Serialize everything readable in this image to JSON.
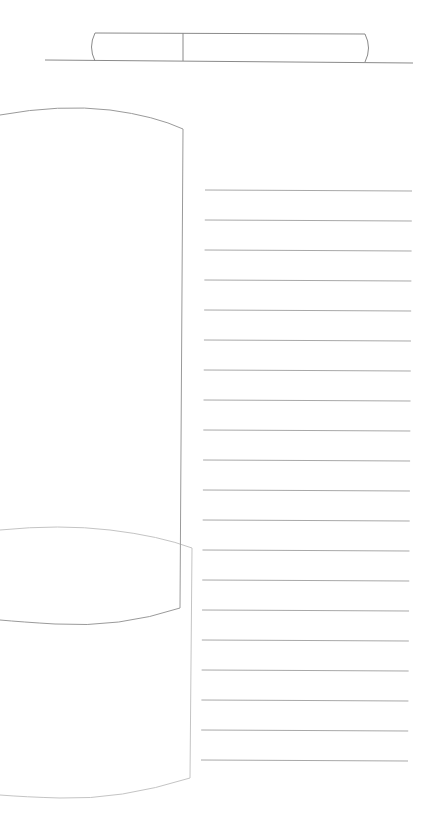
{
  "canvas": {
    "width": 435,
    "height": 839,
    "background": "#ffffff"
  },
  "colors": {
    "stroke_dark": "#8a8a8a",
    "stroke_light": "#bdbdbd",
    "rule": "#a8a8a8"
  },
  "header_tab": {
    "baseline": {
      "x1": 45,
      "y1": 60,
      "x2": 413,
      "y2": 63
    },
    "left_x": 95,
    "divider_x": 183,
    "right_x": 365,
    "top_y": 33,
    "bottom_y": 61
  },
  "upper_panel": {
    "left": 0,
    "right": 183,
    "top_y": 108,
    "corner_y": 128,
    "bottom_y": 610
  },
  "lower_panel": {
    "left": 0,
    "right": 192,
    "top_y": 528,
    "corner_y": 548,
    "bottom_y": 798
  },
  "ruled_lines": {
    "count": 20,
    "start_y": 190,
    "spacing": 30,
    "x_start_top": 205,
    "x_start_bottom": 201,
    "x_end_top": 412,
    "x_end_bottom": 408
  }
}
